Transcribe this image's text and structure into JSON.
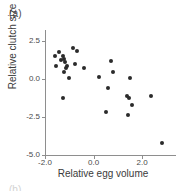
{
  "panel": {
    "label": "(a)",
    "next_label": "(b)"
  },
  "chart_data": {
    "type": "scatter",
    "title": "",
    "xlabel": "Relative egg volume",
    "ylabel": "Relative clutch size",
    "xlim": [
      -2.0,
      3.4
    ],
    "ylim": [
      -5.0,
      3.2
    ],
    "xticks": [
      -2.0,
      0.0,
      2.0
    ],
    "xticklabels": [
      "-2.0",
      "0.0",
      "2.0"
    ],
    "yticks": [
      2.5,
      0.0,
      -2.5,
      -5.0
    ],
    "yticklabels": [
      "2.5",
      "0.0",
      "-2.5",
      "-5.0"
    ],
    "grid": false,
    "legend": false,
    "marker": "filled-circle",
    "marker_color": "#2b2b2b",
    "axis_color": "#8e8e8e",
    "points": [
      {
        "x": -1.58,
        "y": 1.47
      },
      {
        "x": -1.54,
        "y": 0.82
      },
      {
        "x": -1.42,
        "y": 1.73
      },
      {
        "x": -1.33,
        "y": 1.22
      },
      {
        "x": -1.25,
        "y": 1.5
      },
      {
        "x": -1.21,
        "y": 1.28
      },
      {
        "x": -1.17,
        "y": 1.09
      },
      {
        "x": -1.13,
        "y": 0.7
      },
      {
        "x": -1.21,
        "y": 0.45
      },
      {
        "x": -1.08,
        "y": 0.86
      },
      {
        "x": -1.0,
        "y": 0.02
      },
      {
        "x": -0.83,
        "y": 2.05
      },
      {
        "x": -0.67,
        "y": 1.8
      },
      {
        "x": -0.75,
        "y": 0.95
      },
      {
        "x": -0.38,
        "y": 0.7
      },
      {
        "x": -1.25,
        "y": -1.28
      },
      {
        "x": 0.21,
        "y": 0.12
      },
      {
        "x": 0.71,
        "y": 1.15
      },
      {
        "x": 0.79,
        "y": 0.45
      },
      {
        "x": 0.58,
        "y": -0.6
      },
      {
        "x": 0.5,
        "y": -2.15
      },
      {
        "x": 1.5,
        "y": 0.08
      },
      {
        "x": 1.38,
        "y": -1.15
      },
      {
        "x": 1.46,
        "y": -1.25
      },
      {
        "x": 1.58,
        "y": -1.7
      },
      {
        "x": 1.42,
        "y": -2.4
      },
      {
        "x": 2.38,
        "y": -1.1
      },
      {
        "x": 2.83,
        "y": -4.2
      }
    ]
  }
}
